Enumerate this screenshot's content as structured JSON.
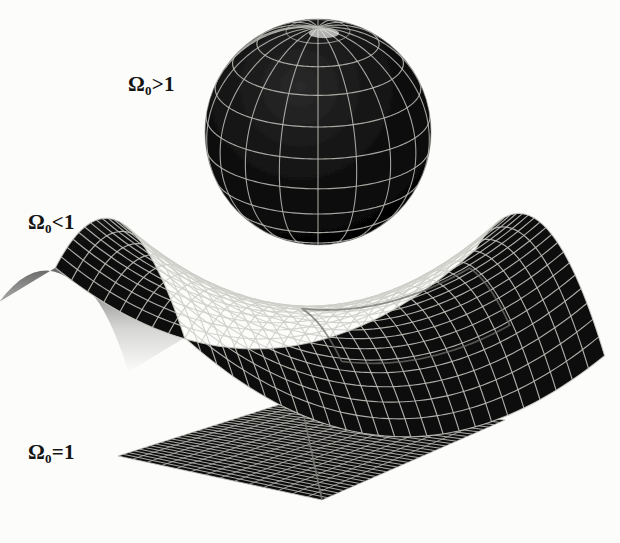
{
  "figure": {
    "background_color": "#fcfcfb",
    "ink_color": "#141414",
    "grid_color": "#d8d8d4",
    "surface_color": "#0a0a0a"
  },
  "labels": [
    {
      "id": "closed",
      "symbol": "Ω",
      "subscript": "0",
      "relation": ">",
      "value": "1",
      "text": "Ω₀>1",
      "geometry": "spherical",
      "x": 128,
      "y": 74
    },
    {
      "id": "open",
      "symbol": "Ω",
      "subscript": "0",
      "relation": "<",
      "value": "1",
      "text": "Ω₀<1",
      "geometry": "hyperbolic",
      "x": 28,
      "y": 212
    },
    {
      "id": "flat",
      "symbol": "Ω",
      "subscript": "0",
      "relation": "=",
      "value": "1",
      "text": "Ω₀=1",
      "geometry": "euclidean",
      "x": 28,
      "y": 442
    }
  ],
  "surfaces": {
    "sphere": {
      "name": "closed-universe-sphere",
      "center_x": 318,
      "center_y": 132,
      "radius": 113,
      "latitude_lines": 11,
      "longitude_lines": 18,
      "tilt_degrees": 22,
      "fill": "#090909",
      "mesh_color": "#cfcfca"
    },
    "saddle": {
      "name": "open-universe-saddle",
      "center_x": 330,
      "center_y": 312,
      "half_width": 210,
      "half_depth": 110,
      "u_divisions": 26,
      "v_divisions": 22,
      "fill": "#0b0b0b",
      "mesh_color": "#ccccc6"
    },
    "plane": {
      "name": "flat-universe-plane",
      "corner_left_x": 118,
      "corner_left_y": 456,
      "corner_top_x": 300,
      "corner_top_y": 398,
      "corner_right_x": 505,
      "corner_right_y": 420,
      "corner_bottom_x": 322,
      "corner_bottom_y": 500,
      "u_divisions": 34,
      "v_divisions": 14,
      "fill": "#111111",
      "mesh_color": "#c9c9c3"
    }
  },
  "chart_data": {
    "type": "diagram",
    "categories": [
      "Ω₀>1",
      "Ω₀<1",
      "Ω₀=1"
    ],
    "series": [
      {
        "name": "curvature",
        "labels": [
          "positive",
          "negative",
          "zero"
        ],
        "values": [
          1,
          -1,
          0
        ]
      }
    ],
    "annotations": [
      "Ω₀>1 — closed, positively curved spherical surface",
      "Ω₀<1 — open, negatively curved saddle surface",
      "Ω₀=1 — flat, zero curvature Euclidean plane"
    ],
    "legend_position": "left",
    "grid": true
  }
}
